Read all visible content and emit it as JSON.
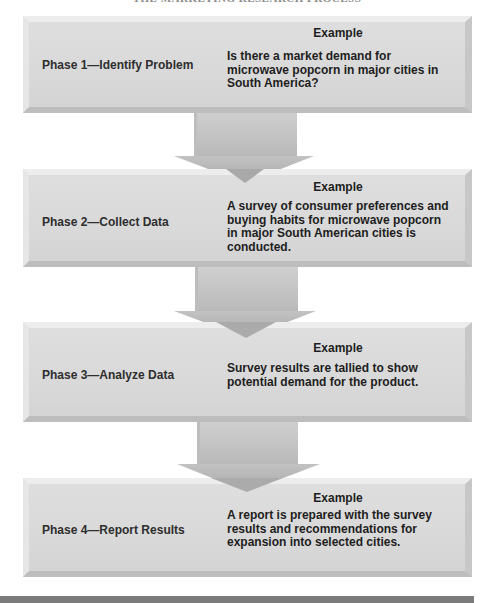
{
  "title": "THE MARKETING RESEARCH PROCESS",
  "phases": [
    {
      "label": "Phase 1—Identify Problem",
      "example_heading": "Example",
      "example_text": "Is there a market demand for microwave popcorn in major cities in South America?"
    },
    {
      "label": "Phase 2—Collect Data",
      "example_heading": "Example",
      "example_text": "A survey of consumer preferences and buying habits for microwave popcorn in major South American cities is conducted."
    },
    {
      "label": "Phase 3—Analyze Data",
      "example_heading": "Example",
      "example_text": "Survey results are tallied to show potential demand for the product."
    },
    {
      "label": "Phase 4—Report Results",
      "example_heading": "Example",
      "example_text": "A report is prepared with the survey results and recommendations for expansion into selected cities."
    }
  ],
  "colors": {
    "box_fill": "#dcdcdc",
    "arrow_fill": "#c4c4c4",
    "bottom_bar": "#7b7b7b",
    "text": "#1e1e1e"
  }
}
